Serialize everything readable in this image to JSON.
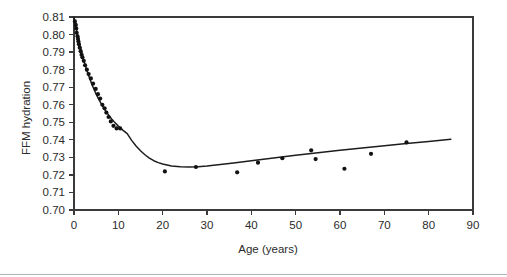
{
  "figure": {
    "background_color": "#ffffff",
    "axis_color": "#3a3a3a",
    "curve_color": "#1d1d1d",
    "point_color": "#111111",
    "footer_rule_color": "#b4b4b4"
  },
  "chart_data": {
    "type": "scatter",
    "title": "",
    "subtitle": "",
    "xlabel": "Age (years)",
    "ylabel": "FFM hydration",
    "xlim": [
      0,
      90
    ],
    "ylim": [
      0.7,
      0.81
    ],
    "xticks": [
      0,
      10,
      20,
      30,
      40,
      50,
      60,
      70,
      80,
      90
    ],
    "xtick_labels": [
      "0",
      "10",
      "20",
      "30",
      "40",
      "50",
      "60",
      "70",
      "80",
      "90"
    ],
    "yticks": [
      0.7,
      0.71,
      0.72,
      0.73,
      0.74,
      0.75,
      0.76,
      0.77,
      0.78,
      0.79,
      0.8,
      0.81
    ],
    "ytick_labels": [
      "0.70",
      "0.71",
      "0.72",
      "0.73",
      "0.74",
      "0.75",
      "0.76",
      "0.77",
      "0.78",
      "0.79",
      "0.80",
      "0.81"
    ],
    "grid": false,
    "legend": false,
    "legend_position": "none",
    "frame": "box",
    "series": [
      {
        "name": "Observed FFM hydration",
        "type": "scatter",
        "marker": "filled-circle",
        "points": [
          {
            "x": 0.2,
            "y": 0.8075
          },
          {
            "x": 0.4,
            "y": 0.8055
          },
          {
            "x": 0.5,
            "y": 0.8035
          },
          {
            "x": 0.6,
            "y": 0.801
          },
          {
            "x": 0.8,
            "y": 0.799
          },
          {
            "x": 0.9,
            "y": 0.7975
          },
          {
            "x": 1.0,
            "y": 0.796
          },
          {
            "x": 1.1,
            "y": 0.7945
          },
          {
            "x": 1.3,
            "y": 0.7925
          },
          {
            "x": 1.5,
            "y": 0.7905
          },
          {
            "x": 1.7,
            "y": 0.7885
          },
          {
            "x": 1.9,
            "y": 0.787
          },
          {
            "x": 2.2,
            "y": 0.785
          },
          {
            "x": 2.5,
            "y": 0.7825
          },
          {
            "x": 2.9,
            "y": 0.78
          },
          {
            "x": 3.3,
            "y": 0.7775
          },
          {
            "x": 3.8,
            "y": 0.775
          },
          {
            "x": 4.3,
            "y": 0.772
          },
          {
            "x": 4.9,
            "y": 0.769
          },
          {
            "x": 5.4,
            "y": 0.766
          },
          {
            "x": 5.9,
            "y": 0.7635
          },
          {
            "x": 6.4,
            "y": 0.76
          },
          {
            "x": 6.9,
            "y": 0.758
          },
          {
            "x": 7.3,
            "y": 0.7555
          },
          {
            "x": 7.8,
            "y": 0.753
          },
          {
            "x": 8.3,
            "y": 0.7505
          },
          {
            "x": 8.9,
            "y": 0.748
          },
          {
            "x": 9.6,
            "y": 0.7465
          },
          {
            "x": 10.4,
            "y": 0.7465
          },
          {
            "x": 20.5,
            "y": 0.722
          },
          {
            "x": 27.5,
            "y": 0.7245
          },
          {
            "x": 36.8,
            "y": 0.7215
          },
          {
            "x": 41.5,
            "y": 0.727
          },
          {
            "x": 47.0,
            "y": 0.7295
          },
          {
            "x": 53.5,
            "y": 0.734
          },
          {
            "x": 54.5,
            "y": 0.729
          },
          {
            "x": 61.0,
            "y": 0.7235
          },
          {
            "x": 67.0,
            "y": 0.732
          },
          {
            "x": 75.0,
            "y": 0.7385
          }
        ]
      },
      {
        "name": "Fitted curve",
        "type": "line",
        "style": "solid",
        "points": [
          {
            "x": 0.0,
            "y": 0.81
          },
          {
            "x": 0.5,
            "y": 0.8035
          },
          {
            "x": 1.0,
            "y": 0.7975
          },
          {
            "x": 1.5,
            "y": 0.7922
          },
          {
            "x": 2.0,
            "y": 0.7872
          },
          {
            "x": 2.5,
            "y": 0.7828
          },
          {
            "x": 3.0,
            "y": 0.7788
          },
          {
            "x": 3.5,
            "y": 0.7752
          },
          {
            "x": 4.0,
            "y": 0.7718
          },
          {
            "x": 4.5,
            "y": 0.7688
          },
          {
            "x": 5.0,
            "y": 0.766
          },
          {
            "x": 5.5,
            "y": 0.7635
          },
          {
            "x": 6.0,
            "y": 0.7612
          },
          {
            "x": 6.5,
            "y": 0.759
          },
          {
            "x": 7.0,
            "y": 0.757
          },
          {
            "x": 7.5,
            "y": 0.7552
          },
          {
            "x": 8.0,
            "y": 0.7535
          },
          {
            "x": 8.5,
            "y": 0.7519
          },
          {
            "x": 9.0,
            "y": 0.7504
          },
          {
            "x": 10.0,
            "y": 0.7478
          },
          {
            "x": 11.0,
            "y": 0.7455
          },
          {
            "x": 12.0,
            "y": 0.7435
          },
          {
            "x": 13.0,
            "y": 0.7397
          },
          {
            "x": 14.0,
            "y": 0.7365
          },
          {
            "x": 15.0,
            "y": 0.7338
          },
          {
            "x": 16.0,
            "y": 0.7315
          },
          {
            "x": 17.0,
            "y": 0.7296
          },
          {
            "x": 18.0,
            "y": 0.7281
          },
          {
            "x": 19.0,
            "y": 0.727
          },
          {
            "x": 20.0,
            "y": 0.7262
          },
          {
            "x": 22.0,
            "y": 0.7251
          },
          {
            "x": 24.0,
            "y": 0.7246
          },
          {
            "x": 26.0,
            "y": 0.7245
          },
          {
            "x": 28.0,
            "y": 0.7247
          },
          {
            "x": 30.0,
            "y": 0.7251
          },
          {
            "x": 33.0,
            "y": 0.7259
          },
          {
            "x": 36.0,
            "y": 0.7268
          },
          {
            "x": 40.0,
            "y": 0.7281
          },
          {
            "x": 45.0,
            "y": 0.7297
          },
          {
            "x": 50.0,
            "y": 0.7312
          },
          {
            "x": 55.0,
            "y": 0.7326
          },
          {
            "x": 60.0,
            "y": 0.734
          },
          {
            "x": 65.0,
            "y": 0.7353
          },
          {
            "x": 70.0,
            "y": 0.7366
          },
          {
            "x": 75.0,
            "y": 0.7379
          },
          {
            "x": 80.0,
            "y": 0.7391
          },
          {
            "x": 85.0,
            "y": 0.7403
          }
        ]
      }
    ]
  }
}
